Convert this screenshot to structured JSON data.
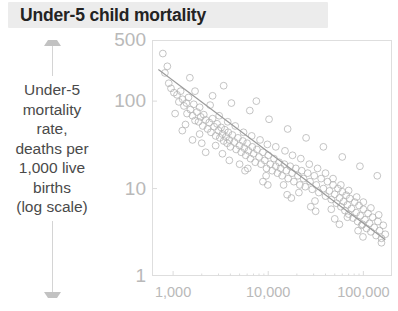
{
  "title": "Under-5 child mortality",
  "axis_caption": "Under-5\nmortality\nrate,\ndeaths per\n1,000 live\nbirths\n(log scale)",
  "colors": {
    "title_text": "#232323",
    "title_band": "#ececec",
    "tick_text": "#b9b9b9",
    "caption_text": "#4a4a4a",
    "frame": "#dedede",
    "point": "#b0b0b0",
    "trend_line": "#9a9a9a"
  },
  "chart_data": {
    "type": "scatter",
    "title": "Under-5 child mortality",
    "xlabel": "",
    "ylabel": "Under-5 mortality rate, deaths per 1,000 live births (log scale)",
    "x_scale": "log",
    "y_scale": "log",
    "xlim": [
      600,
      200000
    ],
    "ylim": [
      1,
      500
    ],
    "xticks": [
      1000,
      10000,
      100000
    ],
    "xticklabels": [
      "1,000",
      "10,000",
      "100,000"
    ],
    "yticks": [
      1,
      10,
      100,
      500
    ],
    "yticklabels": [
      "1",
      "10",
      "100",
      "500"
    ],
    "grid": false,
    "legend": "none",
    "marker": "open-circle",
    "trend_line": {
      "label": "fitted trend",
      "x": [
        700,
        170000
      ],
      "y": [
        230,
        2.6
      ]
    },
    "points": [
      [
        780,
        350
      ],
      [
        820,
        210
      ],
      [
        900,
        160
      ],
      [
        950,
        140
      ],
      [
        1020,
        125
      ],
      [
        1100,
        118
      ],
      [
        1150,
        98
      ],
      [
        1200,
        130
      ],
      [
        1260,
        105
      ],
      [
        1300,
        88
      ],
      [
        1380,
        95
      ],
      [
        1400,
        72
      ],
      [
        1450,
        110
      ],
      [
        1520,
        80
      ],
      [
        1600,
        68
      ],
      [
        1650,
        92
      ],
      [
        1700,
        60
      ],
      [
        1780,
        75
      ],
      [
        1850,
        58
      ],
      [
        1900,
        85
      ],
      [
        1950,
        66
      ],
      [
        2050,
        52
      ],
      [
        2100,
        70
      ],
      [
        2200,
        61
      ],
      [
        2300,
        48
      ],
      [
        2400,
        57
      ],
      [
        2500,
        44
      ],
      [
        2600,
        63
      ],
      [
        2700,
        51
      ],
      [
        2800,
        40
      ],
      [
        2900,
        55
      ],
      [
        3000,
        46
      ],
      [
        3100,
        38
      ],
      [
        3200,
        50
      ],
      [
        3300,
        42
      ],
      [
        3400,
        35
      ],
      [
        3500,
        47
      ],
      [
        3600,
        39
      ],
      [
        3700,
        33
      ],
      [
        3800,
        44
      ],
      [
        3900,
        36
      ],
      [
        4000,
        30
      ],
      [
        4200,
        41
      ],
      [
        4400,
        34
      ],
      [
        4600,
        28
      ],
      [
        4800,
        38
      ],
      [
        5000,
        31
      ],
      [
        5200,
        26
      ],
      [
        5400,
        35
      ],
      [
        5600,
        29
      ],
      [
        5800,
        24
      ],
      [
        6000,
        33
      ],
      [
        6200,
        27
      ],
      [
        6500,
        22
      ],
      [
        6800,
        30
      ],
      [
        7000,
        25
      ],
      [
        7300,
        20
      ],
      [
        7600,
        28
      ],
      [
        8000,
        23
      ],
      [
        8400,
        19
      ],
      [
        8800,
        26
      ],
      [
        9200,
        21
      ],
      [
        9600,
        17
      ],
      [
        10000,
        24
      ],
      [
        10500,
        19
      ],
      [
        11000,
        16
      ],
      [
        11500,
        22
      ],
      [
        12000,
        18
      ],
      [
        12500,
        15
      ],
      [
        13000,
        20
      ],
      [
        13500,
        17
      ],
      [
        14000,
        14
      ],
      [
        14800,
        19
      ],
      [
        15500,
        16
      ],
      [
        16200,
        13
      ],
      [
        17000,
        18
      ],
      [
        17800,
        15
      ],
      [
        18600,
        12
      ],
      [
        19500,
        17
      ],
      [
        20500,
        14
      ],
      [
        21500,
        11
      ],
      [
        22500,
        16
      ],
      [
        23500,
        13
      ],
      [
        24500,
        10.5
      ],
      [
        26000,
        15
      ],
      [
        27500,
        12
      ],
      [
        29000,
        9.8
      ],
      [
        30500,
        14
      ],
      [
        32000,
        11
      ],
      [
        34000,
        9.0
      ],
      [
        36000,
        13
      ],
      [
        38000,
        10
      ],
      [
        40000,
        8.2
      ],
      [
        42000,
        12
      ],
      [
        44000,
        9.4
      ],
      [
        46000,
        7.5
      ],
      [
        48000,
        11
      ],
      [
        50000,
        8.6
      ],
      [
        52000,
        6.8
      ],
      [
        54000,
        10
      ],
      [
        56000,
        7.8
      ],
      [
        58000,
        6.2
      ],
      [
        60000,
        9.2
      ],
      [
        62000,
        7.1
      ],
      [
        64000,
        5.6
      ],
      [
        66000,
        8.4
      ],
      [
        68000,
        6.5
      ],
      [
        70000,
        5.1
      ],
      [
        72000,
        7.7
      ],
      [
        75000,
        5.9
      ],
      [
        78000,
        4.6
      ],
      [
        81000,
        7.0
      ],
      [
        84000,
        5.3
      ],
      [
        87000,
        4.2
      ],
      [
        90000,
        6.4
      ],
      [
        93000,
        4.9
      ],
      [
        96000,
        3.8
      ],
      [
        100000,
        5.8
      ],
      [
        104000,
        4.4
      ],
      [
        108000,
        3.5
      ],
      [
        112000,
        5.2
      ],
      [
        116000,
        4.0
      ],
      [
        120000,
        3.2
      ],
      [
        125000,
        4.7
      ],
      [
        130000,
        3.6
      ],
      [
        136000,
        2.9
      ],
      [
        142000,
        4.2
      ],
      [
        148000,
        3.3
      ],
      [
        155000,
        2.7
      ],
      [
        162000,
        3.8
      ],
      [
        170000,
        3.0
      ],
      [
        1050,
        72
      ],
      [
        1350,
        54
      ],
      [
        1900,
        42
      ],
      [
        2450,
        90
      ],
      [
        3050,
        68
      ],
      [
        3750,
        58
      ],
      [
        4500,
        52
      ],
      [
        5500,
        44
      ],
      [
        6700,
        40
      ],
      [
        8200,
        36
      ],
      [
        9800,
        32
      ],
      [
        12000,
        30
      ],
      [
        15000,
        27
      ],
      [
        18000,
        24
      ],
      [
        22000,
        22
      ],
      [
        27000,
        19
      ],
      [
        33000,
        17
      ],
      [
        40000,
        15
      ],
      [
        48000,
        13
      ],
      [
        58000,
        11
      ],
      [
        70000,
        9.5
      ],
      [
        85000,
        8.0
      ],
      [
        100000,
        7.0
      ],
      [
        120000,
        6.0
      ],
      [
        145000,
        5.0
      ],
      [
        1700,
        130
      ],
      [
        2600,
        115
      ],
      [
        4100,
        95
      ],
      [
        6400,
        78
      ],
      [
        10200,
        62
      ],
      [
        16000,
        48
      ],
      [
        25000,
        38
      ],
      [
        38000,
        30
      ],
      [
        60000,
        23
      ],
      [
        92000,
        18
      ],
      [
        140000,
        14
      ],
      [
        870,
        250
      ],
      [
        1500,
        185
      ],
      [
        3400,
        150
      ],
      [
        7500,
        100
      ],
      [
        2200,
        26
      ],
      [
        3900,
        21
      ],
      [
        6100,
        17
      ],
      [
        9500,
        14
      ],
      [
        14500,
        11
      ],
      [
        21000,
        9.0
      ],
      [
        31000,
        7.2
      ],
      [
        46000,
        5.8
      ],
      [
        68000,
        4.7
      ],
      [
        98000,
        3.9
      ],
      [
        1600,
        36
      ],
      [
        2800,
        31
      ],
      [
        5000,
        19
      ],
      [
        8800,
        12
      ],
      [
        15800,
        8.5
      ],
      [
        28000,
        6.2
      ],
      [
        50000,
        4.5
      ],
      [
        88000,
        3.3
      ],
      [
        155000,
        2.4
      ],
      [
        1250,
        46
      ],
      [
        2000,
        33
      ],
      [
        3300,
        25
      ],
      [
        5700,
        16
      ],
      [
        9900,
        11
      ],
      [
        17500,
        7.8
      ],
      [
        31500,
        5.5
      ],
      [
        56000,
        3.9
      ],
      [
        99000,
        2.8
      ]
    ]
  }
}
